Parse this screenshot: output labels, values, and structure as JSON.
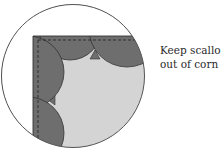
{
  "caption": {
    "line1": "Keep scallo",
    "line2": "out of corn"
  },
  "colors": {
    "background": "#ffffff",
    "circle_stroke": "#555555",
    "border_fill": "#6e6e6e",
    "center_fill": "#d4d4d4",
    "line": "#333333"
  },
  "diagram": {
    "circle": {
      "cx": 73,
      "cy": 76,
      "r": 72
    },
    "corner": {
      "x": 33,
      "y": 36
    }
  }
}
